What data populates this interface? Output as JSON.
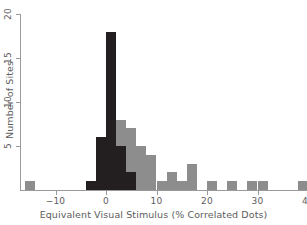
{
  "chart_data": {
    "type": "bar",
    "title": "",
    "xlabel": "Equivalent Visual Stimulus (% Correlated Dots)",
    "ylabel": "Number of Sites",
    "xlim": [
      -17,
      41
    ],
    "ylim": [
      0,
      20
    ],
    "xticks": [
      -10,
      0,
      10,
      20,
      30,
      40
    ],
    "xticklabels": [
      "−10",
      "0",
      "10",
      "20",
      "30",
      "40"
    ],
    "yticks": [
      5,
      10,
      15,
      20
    ],
    "yticklabels": [
      "5",
      "10",
      "15",
      "20"
    ],
    "grid": false,
    "legend": null,
    "bin_width": 2,
    "colors": {
      "dark": "#231f20",
      "light": "#8d8d8d",
      "axis": "#9a9a9a",
      "text": "#5d5d5d",
      "background": "#ffffff"
    },
    "series": [
      {
        "name": "Significant sites",
        "color": "#231f20",
        "bins": [
          {
            "x0": -4,
            "x1": -2,
            "value": 1
          },
          {
            "x0": -2,
            "x1": 0,
            "value": 6
          },
          {
            "x0": 0,
            "x1": 2,
            "value": 18
          },
          {
            "x0": 2,
            "x1": 4,
            "value": 5
          },
          {
            "x0": 4,
            "x1": 6,
            "value": 2
          }
        ]
      },
      {
        "name": "All sites",
        "color": "#8d8d8d",
        "bins": [
          {
            "x0": -16,
            "x1": -14,
            "value": 1
          },
          {
            "x0": 2,
            "x1": 4,
            "value": 8
          },
          {
            "x0": 4,
            "x1": 6,
            "value": 7
          },
          {
            "x0": 6,
            "x1": 8,
            "value": 5
          },
          {
            "x0": 8,
            "x1": 10,
            "value": 4
          },
          {
            "x0": 10,
            "x1": 12,
            "value": 1
          },
          {
            "x0": 12,
            "x1": 14,
            "value": 2
          },
          {
            "x0": 14,
            "x1": 16,
            "value": 1
          },
          {
            "x0": 16,
            "x1": 18,
            "value": 3
          },
          {
            "x0": 20,
            "x1": 22,
            "value": 1
          },
          {
            "x0": 24,
            "x1": 26,
            "value": 1
          },
          {
            "x0": 28,
            "x1": 30,
            "value": 1
          },
          {
            "x0": 30,
            "x1": 32,
            "value": 1
          },
          {
            "x0": 38,
            "x1": 40,
            "value": 1
          }
        ]
      }
    ]
  }
}
